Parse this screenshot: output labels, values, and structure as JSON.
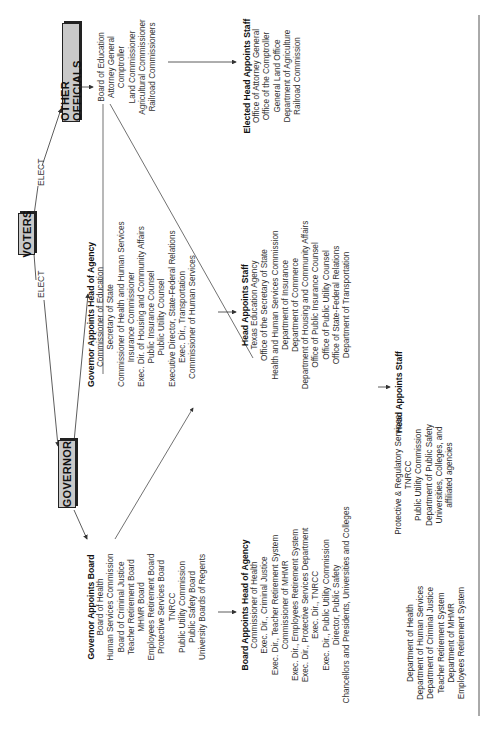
{
  "nodes": {
    "voters": "VOTERS",
    "governor": "GOVERNOR",
    "other_officials": "OTHER OFFICIALS"
  },
  "edge_labels": {
    "elect_governor": "ELECT",
    "elect_other": "ELECT"
  },
  "governor_head_of_agency": {
    "title": "Governor Appoints Head of Agency",
    "items": [
      "Commissioner of Education",
      "Secretary of State",
      "Commissioner of Health and Human Services",
      "Insurance Commissioner",
      "Exec. Dir. of Housing and Community Affairs",
      "Public Insurance Counsel",
      "Public Utility Counsel",
      "Executive Director, State-Federal Relations",
      "Exec. Dir., Transportation",
      "Commissioner of Human Services"
    ]
  },
  "head_appoints_staff_gov": {
    "title": "Head Appoints Staff",
    "items": [
      "Texas Education Agency",
      "Office of the Secretary of State",
      "Health and Human Services Commission",
      "Department of Insurance",
      "Department of Commerce",
      "Department of Housing and Community Affairs",
      "Office of Public Insurance Counsel",
      "Office of Public Utility Counsel",
      "Office of State-Federal Relations",
      "Department of Transportation"
    ]
  },
  "other_officials_list": {
    "items": [
      "Board of Education",
      "Attorney General",
      "Comptroller",
      "Land Commissioner",
      "Agricultural Commissioner",
      "Railroad Commissioners"
    ]
  },
  "elected_head_appoints_staff": {
    "title": "Elected Head Appoints Staff",
    "items": [
      "Office of Attorney General",
      "Office of the Comptroller",
      "General Land Office",
      "Department of Agriculture",
      "Railroad Commission"
    ]
  },
  "governor_appoints_board": {
    "title": "Governor Appoints Board",
    "items": [
      "Board of Health",
      "Human Services Commission",
      "Board of Criminal Justice",
      "Teacher Retirement Board",
      "MHMR Board",
      "Employees Retirement Board",
      "Protective Services Board",
      "TNRCC",
      "Public Utility Commission",
      "Public Safety Board",
      "University Boards of Regents"
    ]
  },
  "board_head_of_agency": {
    "title": "Board Appoints Head of Agency",
    "items": [
      "Commissioner of Health",
      "Exec. Dir., Criminal Justice",
      "Exec. Dir., Teacher Retirement System",
      "Commissioner of MHMR",
      "Exec. Dir., Employees Retirement System",
      "Exec. Dir., Protective Services Department",
      "Exec. Dir., TNRCC",
      "Exec. Dir., Public Utility Commission",
      "Director, Public Safety",
      "Chancellors and Presidents, Universities and Colleges"
    ]
  },
  "head_appoints_staff_board": {
    "title": "Head Appoints Staff",
    "col1": [
      "Department of Health",
      "Department  of Human Services",
      "Department of Criminal Justice",
      "Teacher Retirement System",
      "Department of MHMR",
      "Employees Retirement System"
    ],
    "col2": [
      "Protective & Regulatory Services",
      "TNRCC",
      "Public Utility Commission",
      "Department of Public Safety",
      "Universities, Colleges, and",
      "affiliated agencies"
    ]
  },
  "colors": {
    "box_fill": "#c9c9c9",
    "line": "#333333",
    "text": "#2a2a2a"
  }
}
